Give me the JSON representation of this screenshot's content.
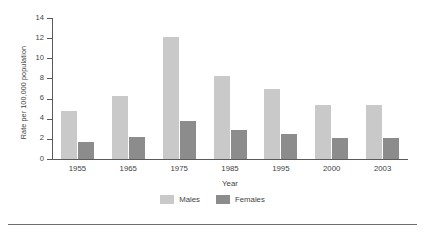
{
  "chart_data": {
    "type": "bar",
    "title": "",
    "subtitle": "",
    "xlabel": "Year",
    "ylabel": "Rate per 100,000 population",
    "categories": [
      "1955",
      "1965",
      "1975",
      "1985",
      "1995",
      "2000",
      "2003"
    ],
    "series": [
      {
        "name": "Males",
        "color": "#c9c9c9",
        "values": [
          4.8,
          6.3,
          12.1,
          8.2,
          7.0,
          5.4,
          5.4
        ]
      },
      {
        "name": "Females",
        "color": "#8c8c8c",
        "values": [
          1.7,
          2.2,
          3.8,
          2.9,
          2.5,
          2.1,
          2.1
        ]
      }
    ],
    "ylim": [
      0,
      14
    ],
    "yticks": [
      "0",
      "2",
      "4",
      "6",
      "8",
      "10",
      "12",
      "14"
    ],
    "ytick_values": [
      0,
      2,
      4,
      6,
      8,
      10,
      12,
      14
    ],
    "grid": false,
    "legend_position": "bottom",
    "axis_color": "#5a5a5a"
  },
  "legend": {
    "items": [
      {
        "label": "Males"
      },
      {
        "label": "Females"
      }
    ]
  }
}
